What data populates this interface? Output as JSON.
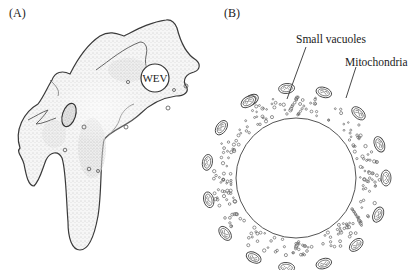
{
  "panels": [
    {
      "id": "A",
      "label": "(A)",
      "subject": "amoeboid cell",
      "inclusions": [
        {
          "label": "WEV",
          "shape": "circle"
        }
      ]
    },
    {
      "id": "B",
      "label": "(B)",
      "subject": "cross-section with central vacuole",
      "callouts": [
        {
          "text": "Small vacuoles"
        },
        {
          "text": "Mitochondria"
        }
      ]
    }
  ],
  "colors": {
    "outline": "#3a3a3a",
    "stipple": "#8a8a8a",
    "background": "#ffffff"
  }
}
